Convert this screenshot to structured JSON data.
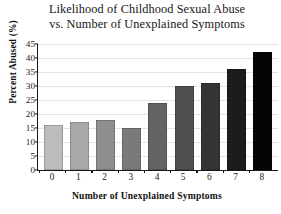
{
  "chart_data": {
    "type": "bar",
    "title": "Likelihood of Childhood Sexual Abuse vs. Number of Unexplained Symptoms",
    "title_lines": [
      "Likelihood of Childhood Sexual Abuse",
      "vs. Number of Unexplained Symptoms"
    ],
    "xlabel": "Number of Unexplained Symptoms",
    "ylabel": "Percent Abused (%)",
    "categories": [
      "0",
      "1",
      "2",
      "3",
      "4",
      "5",
      "6",
      "7",
      "8"
    ],
    "values": [
      16,
      17,
      18,
      15,
      24,
      30,
      31,
      36,
      42
    ],
    "bar_colors": [
      "#bcbcbc",
      "#a8a8a8",
      "#8e8e8e",
      "#7a7a7a",
      "#636363",
      "#4e4e4e",
      "#343434",
      "#1c1c1c",
      "#050505"
    ],
    "ylim": [
      0,
      45
    ],
    "ytick_values": [
      0,
      5,
      10,
      15,
      20,
      25,
      30,
      35,
      40,
      45
    ],
    "ytick_labels": [
      "0",
      "5",
      "10",
      "15",
      "20",
      "25",
      "30",
      "35",
      "40",
      "45"
    ],
    "grid": true,
    "grid_axis": "y",
    "legend": "none",
    "grid_color": "#e3e3e3",
    "axis_color": "#1a1a1a",
    "background": "#ffffff"
  }
}
